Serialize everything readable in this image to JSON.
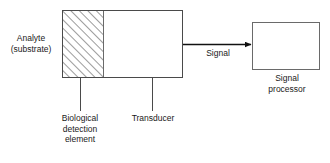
{
  "diagram": {
    "background_color": "#ffffff",
    "line_color": "#1a1a1a",
    "text_color": "#1a1a1a",
    "labels": {
      "analyte": "Analyte\n(substrate)",
      "signal": "Signal",
      "signal_processor": "Signal\nprocessor",
      "biological_detection_element": "Biological\ndetection\nelement",
      "transducer": "Transducer"
    },
    "blocks": [
      {
        "name": "biological-detection-element",
        "fill": "hatched",
        "x": 62,
        "y": 10,
        "width": 41,
        "height": 68
      },
      {
        "name": "transducer",
        "fill": "none",
        "x": 103,
        "y": 10,
        "width": 80,
        "height": 68
      },
      {
        "name": "signal-processor",
        "fill": "none",
        "x": 252,
        "y": 22,
        "width": 68,
        "height": 48
      }
    ],
    "connectors": [
      {
        "name": "signal-arrow",
        "from": "transducer",
        "to": "signal-processor",
        "style": "arrow",
        "y": 44,
        "x1": 183,
        "x2": 252
      },
      {
        "name": "biological-leader",
        "style": "leader-line",
        "x": 80,
        "y1": 78,
        "y2": 111
      },
      {
        "name": "transducer-leader",
        "style": "leader-line",
        "x": 152,
        "y1": 78,
        "y2": 111
      }
    ]
  }
}
